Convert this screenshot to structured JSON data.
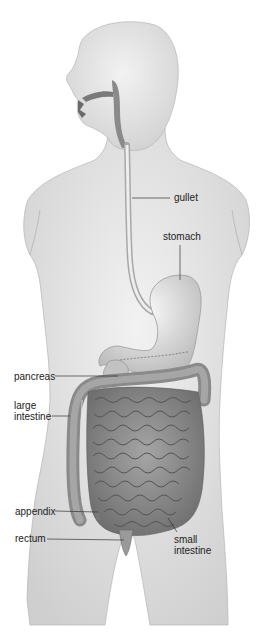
{
  "labels": {
    "gullet": "gullet",
    "stomach": "stomach",
    "pancreas": "pancreas",
    "large_intestine": "large\nintestine",
    "appendix": "appendix",
    "rectum": "rectum",
    "small_intestine": "small\nintestine"
  },
  "colors": {
    "skin": "#e6e6e6",
    "skin_shadow": "#c9c9c9",
    "outline": "#9a9a9a",
    "organ": "#d8d8d8",
    "intestine": "#8f8f8f",
    "intestine_dark": "#6a6a6a",
    "leader": "#333333"
  }
}
